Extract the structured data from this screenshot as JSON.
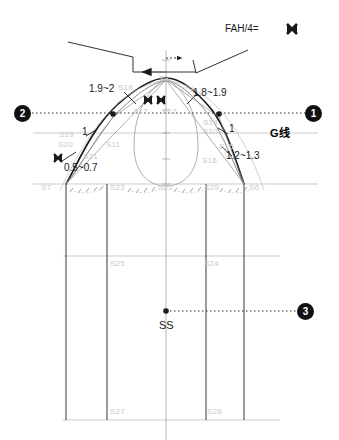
{
  "diagram": {
    "colors": {
      "ink": "#1a1a1a",
      "faint_label": "#c9c9c9",
      "construction_line": "#9a9a9a",
      "heavy_line": "#4a4a4a",
      "marker_fill": "#111111",
      "background": "#ffffff"
    }
  },
  "annotations": {
    "fah_label": "FAH/4=",
    "g_line_label": "G线",
    "ss_label": "SS"
  },
  "dimensions": [
    {
      "id": "dim-left-upper",
      "text": "1.9~2"
    },
    {
      "id": "dim-right-upper",
      "text": "1.8~1.9"
    },
    {
      "id": "dim-left-one",
      "text": "1"
    },
    {
      "id": "dim-right-one",
      "text": "1"
    },
    {
      "id": "dim-right-lower",
      "text": "1.2~1.3"
    },
    {
      "id": "dim-left-lower",
      "text": "0.5~0.7"
    }
  ],
  "markers": [
    {
      "id": "marker-2",
      "label": "2"
    },
    {
      "id": "marker-1",
      "label": "1"
    },
    {
      "id": "marker-3",
      "label": "3"
    }
  ],
  "points": [
    {
      "id": "S3",
      "label": "S3"
    },
    {
      "id": "S18",
      "label": "S18"
    },
    {
      "id": "S13",
      "label": "S13"
    },
    {
      "id": "S17",
      "label": "S17"
    },
    {
      "id": "S12",
      "label": "S12"
    },
    {
      "id": "S14",
      "label": "S14"
    },
    {
      "id": "S10",
      "label": "S10"
    },
    {
      "id": "S19",
      "label": "S19"
    },
    {
      "id": "S20",
      "label": "S20"
    },
    {
      "id": "S21",
      "label": "S21"
    },
    {
      "id": "S11",
      "label": "S11"
    },
    {
      "id": "S15",
      "label": "S15"
    },
    {
      "id": "S16",
      "label": "S16"
    },
    {
      "id": "S7",
      "label": "S7"
    },
    {
      "id": "S23",
      "label": "S23"
    },
    {
      "id": "S22",
      "label": "S22"
    },
    {
      "id": "S29",
      "label": "S29"
    },
    {
      "id": "S6",
      "label": "S6"
    },
    {
      "id": "S25",
      "label": "S25"
    },
    {
      "id": "S24",
      "label": "S24"
    },
    {
      "id": "S27",
      "label": "S27"
    },
    {
      "id": "S26",
      "label": "S26"
    }
  ]
}
